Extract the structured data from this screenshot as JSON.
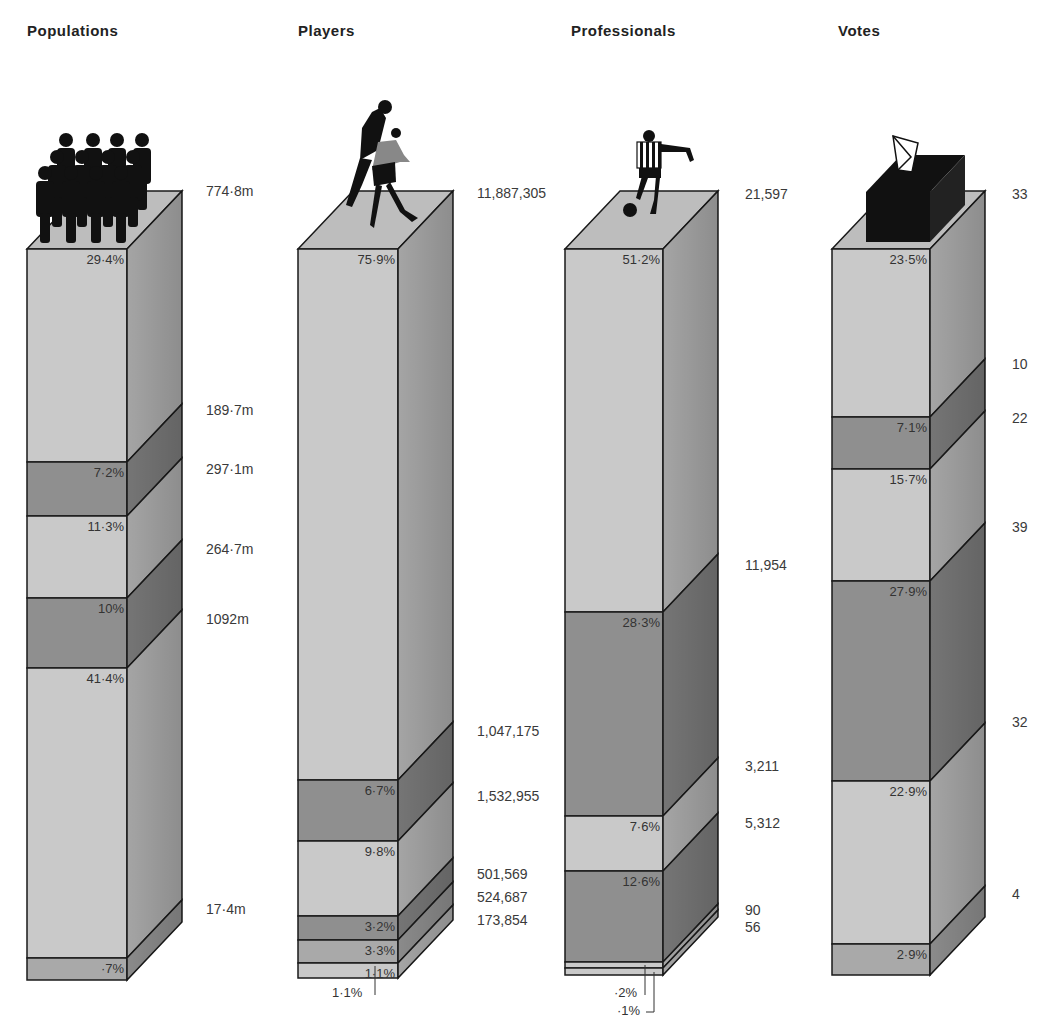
{
  "chart_data": [
    {
      "type": "bar",
      "title": "Populations",
      "categories": [
        "Segment 1",
        "Segment 2",
        "Segment 3",
        "Segment 4",
        "Segment 5",
        "Segment 6"
      ],
      "values_pct": [
        29.4,
        7.2,
        11.3,
        10,
        41.4,
        0.7
      ],
      "pct_labels": [
        "29·4%",
        "7·2%",
        "11·3%",
        "10%",
        "41·4%",
        "·7%"
      ],
      "side_labels": [
        "774·8m",
        "189·7m",
        "297·1m",
        "264·7m",
        "1092m",
        "17·4m"
      ],
      "icon": "crowd-icon"
    },
    {
      "type": "bar",
      "title": "Players",
      "categories": [
        "Segment 1",
        "Segment 2",
        "Segment 3",
        "Segment 4",
        "Segment 5",
        "Segment 6"
      ],
      "values_pct": [
        75.9,
        6.7,
        9.8,
        3.2,
        3.3,
        1.1
      ],
      "pct_labels": [
        "75·9%",
        "6·7%",
        "9·8%",
        "3·2%",
        "3·3%",
        "1·1%"
      ],
      "side_labels": [
        "11,887,305",
        "1,047,175",
        "1,532,955",
        "501,569",
        "524,687",
        "173,854"
      ],
      "icon": "football-players-icon"
    },
    {
      "type": "bar",
      "title": "Professionals",
      "categories": [
        "Segment 1",
        "Segment 2",
        "Segment 3",
        "Segment 4",
        "Segment 5",
        "Segment 6"
      ],
      "values_pct": [
        51.2,
        28.3,
        7.6,
        12.6,
        0.2,
        0.1
      ],
      "pct_labels": [
        "51·2%",
        "28·3%",
        "7·6%",
        "12·6%",
        "·2%",
        "·1%"
      ],
      "side_labels": [
        "21,597",
        "11,954",
        "3,211",
        "5,312",
        "90",
        "56"
      ],
      "icon": "footballer-icon"
    },
    {
      "type": "bar",
      "title": "Votes",
      "categories": [
        "Segment 1",
        "Segment 2",
        "Segment 3",
        "Segment 4",
        "Segment 5",
        "Segment 6"
      ],
      "values_pct": [
        23.5,
        7.1,
        15.7,
        27.9,
        22.9,
        2.9
      ],
      "pct_labels": [
        "23·5%",
        "7·1%",
        "15·7%",
        "27·9%",
        "22·9%",
        "2·9%"
      ],
      "side_labels": [
        "33",
        "10",
        "22",
        "39",
        "32",
        "4"
      ],
      "icon": "ballot-box-icon"
    }
  ],
  "colors": {
    "light": "#c9c9c9",
    "mid": "#a9a9a9",
    "dark": "#8f8f8f",
    "top": "#bdbdbd",
    "outline": "#1a1a1a"
  },
  "columns": [
    {
      "title": "Populations"
    },
    {
      "title": "Players"
    },
    {
      "title": "Professionals"
    },
    {
      "title": "Votes"
    }
  ]
}
